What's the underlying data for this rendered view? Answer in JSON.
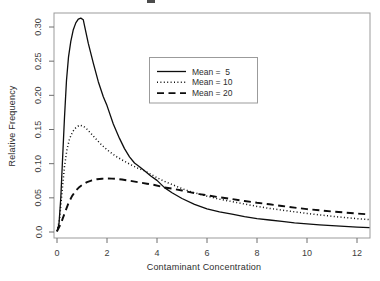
{
  "chart_data": {
    "type": "line",
    "title": "",
    "xlabel": "Contaminant Concentration",
    "ylabel": "Relative Frequency",
    "xlim": [
      -0.12,
      12.52
    ],
    "ylim": [
      -0.013,
      0.3205
    ],
    "grid": false,
    "x_ticks": [
      0,
      2,
      4,
      6,
      8,
      10,
      12
    ],
    "x_tick_labels": [
      "0",
      "2",
      "4",
      "6",
      "8",
      "10",
      "12"
    ],
    "y_ticks": [
      0.0,
      0.05,
      0.1,
      0.15,
      0.2,
      0.25,
      0.3
    ],
    "y_tick_labels": [
      "0.0",
      "0.05",
      "0.10",
      "0.15",
      "0.20",
      "0.25",
      "0.30"
    ],
    "colors": {
      "line": "#000000",
      "frame": "#9b9b9b",
      "background": "#ffffff"
    },
    "legend": {
      "position": "inside-upper-middle",
      "border": true,
      "entries": [
        {
          "label": "Mean =  5",
          "style": "solid"
        },
        {
          "label": "Mean = 10",
          "style": "dotted"
        },
        {
          "label": "Mean = 20",
          "style": "dashed"
        }
      ]
    },
    "series": [
      {
        "name": "Mean = 5",
        "style": "solid",
        "points": [
          [
            0,
            0.001
          ],
          [
            0.08,
            0.012
          ],
          [
            0.15,
            0.05
          ],
          [
            0.22,
            0.105
          ],
          [
            0.3,
            0.168
          ],
          [
            0.38,
            0.222
          ],
          [
            0.46,
            0.256
          ],
          [
            0.55,
            0.279
          ],
          [
            0.65,
            0.296
          ],
          [
            0.75,
            0.306
          ],
          [
            0.85,
            0.3115
          ],
          [
            0.95,
            0.313
          ],
          [
            1.05,
            0.3105
          ],
          [
            1.1,
            0.302
          ],
          [
            1.25,
            0.276
          ],
          [
            1.45,
            0.247
          ],
          [
            1.65,
            0.22
          ],
          [
            1.85,
            0.198
          ],
          [
            2.0,
            0.185
          ],
          [
            2.25,
            0.158
          ],
          [
            2.5,
            0.137
          ],
          [
            2.7,
            0.122
          ],
          [
            2.9,
            0.11
          ],
          [
            3.1,
            0.101
          ],
          [
            3.3,
            0.0955
          ],
          [
            3.5,
            0.0895
          ],
          [
            3.75,
            0.082
          ],
          [
            4.0,
            0.0755
          ],
          [
            4.3,
            0.065
          ],
          [
            4.6,
            0.0575
          ],
          [
            5.0,
            0.049
          ],
          [
            5.5,
            0.0405
          ],
          [
            6.0,
            0.034
          ],
          [
            6.5,
            0.0295
          ],
          [
            7.0,
            0.026
          ],
          [
            7.5,
            0.0225
          ],
          [
            8.0,
            0.0195
          ],
          [
            8.5,
            0.0175
          ],
          [
            9.0,
            0.0155
          ],
          [
            9.5,
            0.0135
          ],
          [
            10.0,
            0.0118
          ],
          [
            10.5,
            0.0105
          ],
          [
            11.0,
            0.0092
          ],
          [
            11.5,
            0.0082
          ],
          [
            12.0,
            0.0072
          ],
          [
            12.5,
            0.0065
          ]
        ]
      },
      {
        "name": "Mean = 10",
        "style": "dotted",
        "points": [
          [
            0,
            0.001
          ],
          [
            0.1,
            0.018
          ],
          [
            0.2,
            0.058
          ],
          [
            0.3,
            0.096
          ],
          [
            0.4,
            0.121
          ],
          [
            0.5,
            0.136
          ],
          [
            0.62,
            0.1465
          ],
          [
            0.75,
            0.1525
          ],
          [
            0.9,
            0.1565
          ],
          [
            1.05,
            0.155
          ],
          [
            1.2,
            0.1505
          ],
          [
            1.35,
            0.1445
          ],
          [
            1.5,
            0.1385
          ],
          [
            1.7,
            0.1305
          ],
          [
            1.9,
            0.1235
          ],
          [
            2.1,
            0.1175
          ],
          [
            2.35,
            0.111
          ],
          [
            2.6,
            0.1055
          ],
          [
            2.9,
            0.0995
          ],
          [
            3.2,
            0.094
          ],
          [
            3.5,
            0.0895
          ],
          [
            3.8,
            0.0835
          ],
          [
            4.1,
            0.0775
          ],
          [
            4.4,
            0.0725
          ],
          [
            4.7,
            0.068
          ],
          [
            5.0,
            0.0635
          ],
          [
            5.35,
            0.059
          ],
          [
            5.7,
            0.0555
          ],
          [
            6.1,
            0.0515
          ],
          [
            6.5,
            0.048
          ],
          [
            7.0,
            0.0445
          ],
          [
            7.5,
            0.041
          ],
          [
            8.0,
            0.0375
          ],
          [
            8.5,
            0.0345
          ],
          [
            9.0,
            0.032
          ],
          [
            9.5,
            0.0295
          ],
          [
            10.0,
            0.0272
          ],
          [
            10.5,
            0.025
          ],
          [
            11.0,
            0.023
          ],
          [
            11.5,
            0.0212
          ],
          [
            12.0,
            0.0196
          ],
          [
            12.5,
            0.0182
          ]
        ]
      },
      {
        "name": "Mean = 20",
        "style": "dashed",
        "points": [
          [
            0,
            0.001
          ],
          [
            0.15,
            0.012
          ],
          [
            0.3,
            0.027
          ],
          [
            0.45,
            0.0415
          ],
          [
            0.6,
            0.0525
          ],
          [
            0.75,
            0.0605
          ],
          [
            0.9,
            0.066
          ],
          [
            1.05,
            0.07
          ],
          [
            1.2,
            0.073
          ],
          [
            1.4,
            0.0757
          ],
          [
            1.6,
            0.0772
          ],
          [
            1.8,
            0.078
          ],
          [
            2.0,
            0.0783
          ],
          [
            2.2,
            0.0782
          ],
          [
            2.4,
            0.0777
          ],
          [
            2.6,
            0.0768
          ],
          [
            2.8,
            0.0757
          ],
          [
            3.0,
            0.0745
          ],
          [
            3.3,
            0.0726
          ],
          [
            3.6,
            0.0707
          ],
          [
            3.9,
            0.0688
          ],
          [
            4.3,
            0.0651
          ],
          [
            4.6,
            0.0635
          ],
          [
            5.0,
            0.0607
          ],
          [
            5.35,
            0.058
          ],
          [
            5.7,
            0.0555
          ],
          [
            6.0,
            0.0537
          ],
          [
            6.5,
            0.0508
          ],
          [
            7.0,
            0.0482
          ],
          [
            7.5,
            0.0453
          ],
          [
            8.0,
            0.0428
          ],
          [
            8.5,
            0.0405
          ],
          [
            9.0,
            0.038
          ],
          [
            9.5,
            0.0357
          ],
          [
            10.0,
            0.0335
          ],
          [
            10.5,
            0.0317
          ],
          [
            11.0,
            0.03
          ],
          [
            11.5,
            0.0285
          ],
          [
            12.0,
            0.027
          ],
          [
            12.5,
            0.0257
          ]
        ]
      }
    ]
  }
}
